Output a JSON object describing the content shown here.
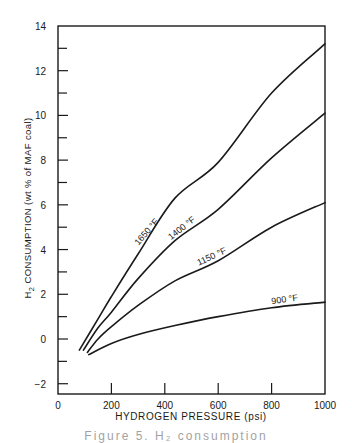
{
  "chart_data": {
    "type": "line",
    "title": "",
    "xlabel": "HYDROGEN PRESSURE (psi)",
    "ylabel_prefix": "H",
    "ylabel_sub": "2",
    "ylabel_rest": " CONSUMPTION (wt % of MAF coal)",
    "xlim": [
      0,
      1000
    ],
    "ylim": [
      -2.6,
      14
    ],
    "x_ticks": [
      0,
      200,
      400,
      600,
      800,
      1000
    ],
    "x_tick_labels": [
      "0",
      "200",
      "400",
      "600",
      "800",
      "1000"
    ],
    "y_ticks_major": [
      -2,
      0,
      2,
      4,
      6,
      8,
      10,
      12,
      14
    ],
    "y_tick_labels": [
      "−2",
      "0",
      "2",
      "4",
      "6",
      "8",
      "10",
      "12",
      "14"
    ],
    "y_ticks_minor": [
      -1,
      1,
      3,
      5,
      7,
      9,
      11,
      13
    ],
    "grid": false,
    "legend": "inline curve labels",
    "series": [
      {
        "name": "1650 °F",
        "label": "1650 °F",
        "x": [
          80,
          150,
          200,
          300,
          438,
          600,
          800,
          1000
        ],
        "y": [
          -0.5,
          0.9,
          1.9,
          3.8,
          6.3,
          7.9,
          11.0,
          13.2
        ],
        "label_at": 340,
        "label_angle": -49
      },
      {
        "name": "1400 °F",
        "label": "1400 °F",
        "x": [
          95,
          150,
          200,
          300,
          438,
          600,
          800,
          1000
        ],
        "y": [
          -0.5,
          0.5,
          1.2,
          2.7,
          4.4,
          5.8,
          8.1,
          10.1
        ],
        "label_at": 470,
        "label_angle": -38
      },
      {
        "name": "1150 °F",
        "label": "1150 °F",
        "x": [
          110,
          150,
          200,
          300,
          438,
          600,
          800,
          1000
        ],
        "y": [
          -0.6,
          0.0,
          0.55,
          1.5,
          2.6,
          3.5,
          5.0,
          6.1
        ],
        "label_at": 580,
        "label_angle": -25
      },
      {
        "name": "900 °F",
        "label": "900 °F",
        "x": [
          115,
          200,
          300,
          438,
          600,
          800,
          1000
        ],
        "y": [
          -0.7,
          -0.2,
          0.2,
          0.6,
          1.0,
          1.4,
          1.65
        ],
        "label_at": 850,
        "label_angle": -8
      }
    ]
  },
  "caption": "Figure 5.  H₂ consumption"
}
